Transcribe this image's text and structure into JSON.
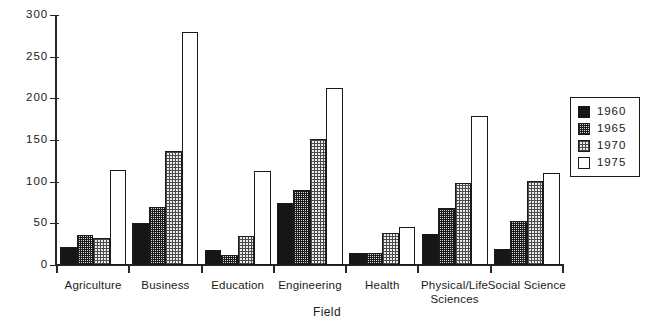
{
  "chart_data": {
    "type": "bar",
    "title": "",
    "xlabel": "Field",
    "ylabel": "",
    "ylim": [
      0,
      300
    ],
    "yticks": [
      0,
      50,
      100,
      150,
      200,
      250,
      300
    ],
    "grid": false,
    "legend_position": "right",
    "categories": [
      "Agriculture",
      "Business",
      "Education",
      "Engineering",
      "Health",
      "Physical/Life\nSciences",
      "Social Science"
    ],
    "series": [
      {
        "name": "1960",
        "pattern": "solid-black",
        "values": [
          22,
          50,
          18,
          74,
          14,
          37,
          19
        ]
      },
      {
        "name": "1965",
        "pattern": "dark-checkerboard",
        "values": [
          36,
          70,
          12,
          90,
          14,
          68,
          53
        ]
      },
      {
        "name": "1970",
        "pattern": "light-stipple",
        "values": [
          33,
          137,
          35,
          151,
          39,
          98,
          101
        ]
      },
      {
        "name": "1975",
        "pattern": "white-outline",
        "values": [
          114,
          280,
          113,
          213,
          46,
          179,
          110
        ]
      }
    ]
  },
  "axis": {
    "x_title": "Field",
    "y_tick_labels": [
      "300",
      "250",
      "200",
      "150",
      "100",
      "50",
      "0"
    ]
  },
  "legend": {
    "items": [
      {
        "label": "1960",
        "pattern": "solid-black"
      },
      {
        "label": "1965",
        "pattern": "dark-checkerboard"
      },
      {
        "label": "1970",
        "pattern": "light-stipple"
      },
      {
        "label": "1975",
        "pattern": "white-outline"
      }
    ]
  }
}
